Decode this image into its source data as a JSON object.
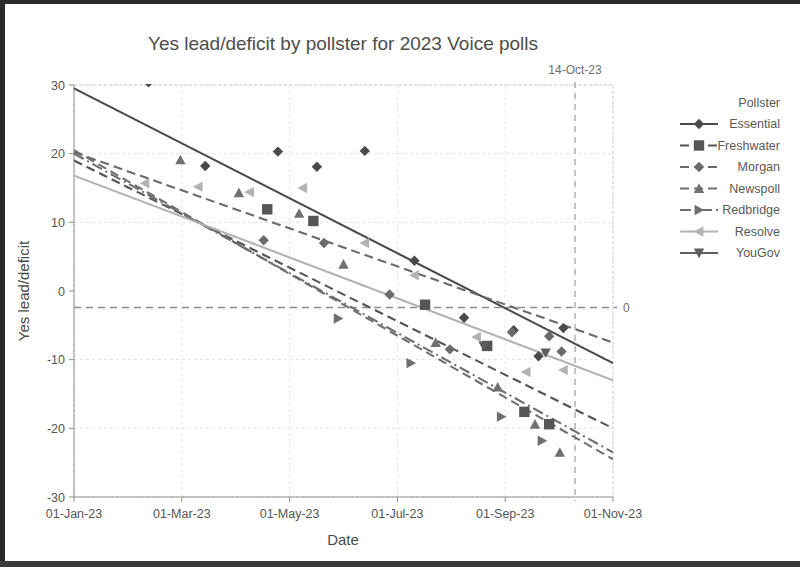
{
  "chart_data": {
    "type": "scatter",
    "title": "Yes lead/deficit by pollster for 2023 Voice polls",
    "xlabel": "Date",
    "ylabel": "Yes lead/deficit",
    "legend_title": "Pollster",
    "legend_position": "right",
    "grid": true,
    "xlim": [
      "01-Jan-23",
      "01-Nov-23"
    ],
    "ylim": [
      -30,
      30
    ],
    "yticks": [
      30,
      20,
      10,
      0,
      -10,
      -20,
      -30
    ],
    "ytick_labels": [
      "30",
      "20",
      "10",
      "0",
      "-10",
      "-20",
      "-30"
    ],
    "xticks": [
      "01-Jan-23",
      "01-Mar-23",
      "01-May-23",
      "01-Jul-23",
      "01-Sep-23",
      "01-Nov-23"
    ],
    "xtick_labels": [
      "01-Jan-23",
      "01-Mar-23",
      "01-May-23",
      "01-Jul-23",
      "01-Sep-23",
      "01-Nov-23"
    ],
    "reference_lines": [
      {
        "name": "referendum-date-line",
        "orientation": "vertical",
        "value": "14-Oct-23",
        "label": "14-Oct-23",
        "style": "dashed"
      },
      {
        "name": "zero-line",
        "orientation": "horizontal",
        "value": 0,
        "label": "0",
        "style": "dashed"
      }
    ],
    "series": [
      {
        "name": "Essential",
        "color": "#4a4a4a",
        "marker": "diamond",
        "line_style": "solid",
        "points": [
          {
            "x": "2023-02-12",
            "y": 30.4
          },
          {
            "x": "2023-03-16",
            "y": 18.2
          },
          {
            "x": "2023-04-26",
            "y": 20.3
          },
          {
            "x": "2023-05-18",
            "y": 18.1
          },
          {
            "x": "2023-06-14",
            "y": 20.4
          },
          {
            "x": "2023-07-12",
            "y": 4.4
          },
          {
            "x": "2023-08-09",
            "y": -3.9
          },
          {
            "x": "2023-09-06",
            "y": -5.7
          },
          {
            "x": "2023-09-20",
            "y": -9.5
          },
          {
            "x": "2023-10-04",
            "y": -5.4
          }
        ],
        "trend": {
          "start_y": 29.5,
          "end_y": -10.5
        }
      },
      {
        "name": "Freshwater",
        "color": "#555555",
        "marker": "square",
        "line_style": "dashed",
        "points": [
          {
            "x": "2023-04-20",
            "y": 11.9
          },
          {
            "x": "2023-05-16",
            "y": 10.2
          },
          {
            "x": "2023-07-18",
            "y": -2.0
          },
          {
            "x": "2023-08-22",
            "y": -8.0
          },
          {
            "x": "2023-09-12",
            "y": -17.6
          },
          {
            "x": "2023-09-26",
            "y": -19.4
          }
        ],
        "trend": {
          "start_y": 19.0,
          "end_y": -20.0
        }
      },
      {
        "name": "Morgan",
        "color": "#6a6a6a",
        "marker": "diamond",
        "line_style": "dashed",
        "points": [
          {
            "x": "2023-04-18",
            "y": 7.4
          },
          {
            "x": "2023-05-22",
            "y": 7.0
          },
          {
            "x": "2023-06-28",
            "y": -0.5
          },
          {
            "x": "2023-08-01",
            "y": -8.5
          },
          {
            "x": "2023-09-05",
            "y": -6.0
          },
          {
            "x": "2023-09-26",
            "y": -6.6
          },
          {
            "x": "2023-10-03",
            "y": -8.8
          }
        ],
        "trend": {
          "start_y": 20.2,
          "end_y": -7.5
        }
      },
      {
        "name": "Newspoll",
        "color": "#707070",
        "marker": "triangle-up",
        "line_style": "dashed",
        "points": [
          {
            "x": "2023-03-02",
            "y": 19.1
          },
          {
            "x": "2023-04-04",
            "y": 14.3
          },
          {
            "x": "2023-05-08",
            "y": 11.3
          },
          {
            "x": "2023-06-02",
            "y": 3.9
          },
          {
            "x": "2023-07-24",
            "y": -7.5
          },
          {
            "x": "2023-08-28",
            "y": -14.0
          },
          {
            "x": "2023-09-18",
            "y": -19.4
          },
          {
            "x": "2023-10-02",
            "y": -23.5
          }
        ],
        "trend": {
          "start_y": 20.5,
          "end_y": -24.5
        }
      },
      {
        "name": "Redbridge",
        "color": "#6e6e6e",
        "marker": "triangle-right",
        "line_style": "dash-dot",
        "points": [
          {
            "x": "2023-05-30",
            "y": -4.0
          },
          {
            "x": "2023-07-10",
            "y": -10.5
          },
          {
            "x": "2023-08-30",
            "y": -18.3
          },
          {
            "x": "2023-09-22",
            "y": -21.8
          }
        ],
        "trend": {
          "start_y": 20.0,
          "end_y": -23.5
        }
      },
      {
        "name": "Resolve",
        "color": "#b2b2b2",
        "marker": "triangle-left",
        "line_style": "solid",
        "points": [
          {
            "x": "2023-02-10",
            "y": 15.7
          },
          {
            "x": "2023-03-12",
            "y": 15.2
          },
          {
            "x": "2023-04-10",
            "y": 14.4
          },
          {
            "x": "2023-05-10",
            "y": 15.0
          },
          {
            "x": "2023-06-14",
            "y": 7.0
          },
          {
            "x": "2023-07-12",
            "y": 2.3
          },
          {
            "x": "2023-08-16",
            "y": -6.7
          },
          {
            "x": "2023-09-13",
            "y": -11.8
          },
          {
            "x": "2023-10-04",
            "y": -11.5
          }
        ],
        "trend": {
          "start_y": 16.8,
          "end_y": -13.0
        }
      },
      {
        "name": "YouGov",
        "color": "#5e5e5e",
        "marker": "triangle-down",
        "line_style": "solid",
        "points": [
          {
            "x": "2023-08-20",
            "y": -8.0
          },
          {
            "x": "2023-09-24",
            "y": -9.0
          }
        ],
        "trend": null
      }
    ]
  },
  "legend": {
    "title": "Pollster",
    "entries": [
      {
        "label": "Essential"
      },
      {
        "label": "Freshwater"
      },
      {
        "label": "Morgan"
      },
      {
        "label": "Newspoll"
      },
      {
        "label": "Redbridge"
      },
      {
        "label": "Resolve"
      },
      {
        "label": "YouGov"
      }
    ]
  },
  "annotations": {
    "referendum_date": "14-Oct-23",
    "zero_right": "0"
  }
}
